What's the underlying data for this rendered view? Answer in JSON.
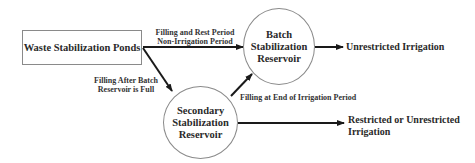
{
  "diagram": {
    "type": "flowchart",
    "nodes": {
      "ponds": {
        "label": "Waste Stabilization Ponds",
        "shape": "rectangle"
      },
      "batch": {
        "label_lines": [
          "Batch",
          "Stabilization",
          "Reservoir"
        ],
        "shape": "circle"
      },
      "secondary": {
        "label_lines": [
          "Secondary",
          "Stabilization",
          "Reservoir"
        ],
        "shape": "circle"
      },
      "unrestricted": {
        "label": "Unrestricted Irrigation",
        "shape": "text"
      },
      "restricted": {
        "label": "Restricted or Unrestricted Irrigation",
        "shape": "text"
      }
    },
    "edges": {
      "ponds_to_batch": {
        "label_lines": [
          "Filling  and Rest Period",
          "Non-Irrigation  Period"
        ]
      },
      "ponds_to_secondary": {
        "label_lines": [
          "Filling  After Batch",
          "Reservoir is Full"
        ]
      },
      "secondary_to_batch": {
        "label": "Filling  at End of Irrigation  Period"
      },
      "batch_to_unrestricted": {
        "label": ""
      },
      "secondary_to_restricted": {
        "label": ""
      }
    },
    "colors": {
      "arrow": "#1a1a1a",
      "node_border": "#8a8a8a",
      "text": "#2a2a2a",
      "background": "#ffffff"
    }
  }
}
